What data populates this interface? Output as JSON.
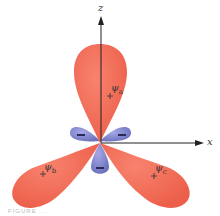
{
  "diagram": {
    "axes": {
      "z_label": "z",
      "x_label": "x"
    },
    "orbitals": [
      {
        "label": "ψa",
        "symbol": "ψ",
        "subscript": "a",
        "sign": "+",
        "color": "#f0705a"
      },
      {
        "label": "ψb",
        "symbol": "ψ",
        "subscript": "b",
        "sign": "+",
        "color": "#f0705a"
      },
      {
        "label": "ψc",
        "symbol": "ψ",
        "subscript": "c",
        "sign": "+",
        "color": "#f0705a"
      }
    ],
    "minor_lobes": [
      {
        "sign": "−",
        "color": "#7b80c8"
      },
      {
        "sign": "−",
        "color": "#7b80c8"
      },
      {
        "sign": "−",
        "color": "#7b80c8"
      }
    ],
    "caption": "FIGURE ..."
  }
}
